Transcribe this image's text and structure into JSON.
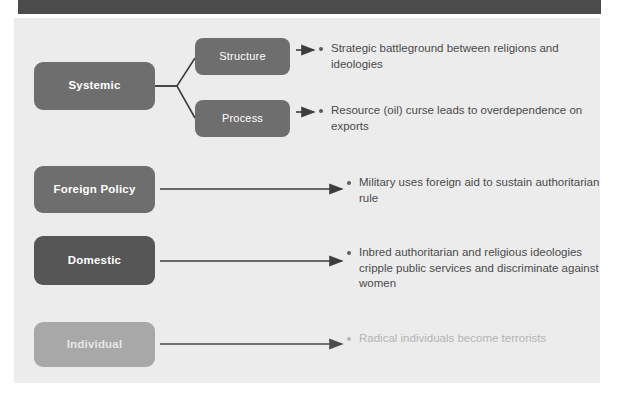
{
  "slide": {
    "title": "Levels of Analysis Causal Diagram",
    "header_band_color": "#4b4b4b",
    "panel_background": "#ececed"
  },
  "nodes": {
    "systemic": {
      "label": "Systemic",
      "color": "#6e6e6e"
    },
    "structure": {
      "label": "Structure",
      "color": "#6e6e6e"
    },
    "process": {
      "label": "Process",
      "color": "#6e6e6e"
    },
    "foreign_policy": {
      "label": "Foreign Policy",
      "color": "#6e6e6e"
    },
    "domestic": {
      "label": "Domestic",
      "color": "#565656"
    },
    "individual": {
      "label": "Individual",
      "color": "#a8a8a8"
    }
  },
  "bullets": {
    "structure": "Strategic battleground between religions and ideologies",
    "process": "Resource (oil) curse leads to overdependence on exports",
    "foreign_policy": "Military uses foreign aid to sustain authoritarian rule",
    "domestic": "Inbred authoritarian and religious ideologies cripple public services and discriminate against women",
    "individual": "Radical individuals become terrorists"
  },
  "connectors": {
    "systemic_to_structure": "branch-line",
    "systemic_to_process": "branch-line",
    "structure_to_bullet": "short-arrow",
    "process_to_bullet": "short-arrow",
    "foreign_policy_to_bullet": "long-arrow",
    "domestic_to_bullet": "long-arrow",
    "individual_to_bullet": "long-arrow"
  },
  "colors": {
    "line": "#3d3d3d",
    "line_faded": "#6a6a6a",
    "text": "#4a4a4a",
    "text_faded": "#b4b4b4"
  }
}
